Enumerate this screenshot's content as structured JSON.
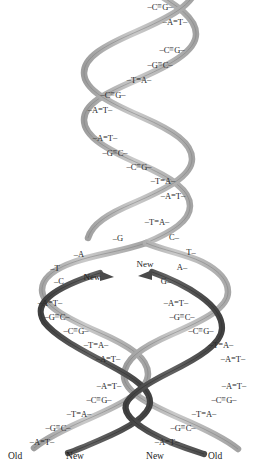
{
  "figure": {
    "colors": {
      "old_strand": "#b4b4b4",
      "old_strand_edge": "#8a8a8a",
      "new_strand": "#555555",
      "new_strand_edge": "#3a3a3a",
      "text": "#2a2a2a",
      "background": "#ffffff"
    }
  },
  "parent_helix": {
    "name": "parental-double-helix",
    "base_pairs": [
      {
        "left": "C",
        "bond": "triple",
        "right": "G",
        "x": 160,
        "y": 7
      },
      {
        "left": "A",
        "bond": "double",
        "right": "T",
        "x": 175,
        "y": 22
      },
      {
        "left": "C",
        "bond": "triple",
        "right": "G",
        "x": 172,
        "y": 50
      },
      {
        "left": "G",
        "bond": "triple",
        "right": "C",
        "x": 160,
        "y": 65
      },
      {
        "left": "T",
        "bond": "double",
        "right": "A",
        "x": 139,
        "y": 80
      },
      {
        "left": "C",
        "bond": "triple",
        "right": "G",
        "x": 113,
        "y": 95
      },
      {
        "left": "A",
        "bond": "double",
        "right": "T",
        "x": 100,
        "y": 110
      },
      {
        "left": "A",
        "bond": "double",
        "right": "T",
        "x": 105,
        "y": 138
      },
      {
        "left": "G",
        "bond": "triple",
        "right": "C",
        "x": 115,
        "y": 153
      },
      {
        "left": "C",
        "bond": "triple",
        "right": "G",
        "x": 139,
        "y": 167
      },
      {
        "left": "T",
        "bond": "double",
        "right": "A",
        "x": 163,
        "y": 181
      },
      {
        "left": "A",
        "bond": "double",
        "right": "T",
        "x": 173,
        "y": 196
      },
      {
        "left": "T",
        "bond": "double",
        "right": "A",
        "x": 157,
        "y": 222
      }
    ]
  },
  "fork": {
    "name": "replication-fork",
    "left_unpaired": [
      {
        "base": "G",
        "x": 118,
        "y": 238
      },
      {
        "base": "A",
        "x": 79,
        "y": 254
      },
      {
        "base": "T",
        "x": 55,
        "y": 268
      },
      {
        "base": "C",
        "x": 59,
        "y": 281
      }
    ],
    "right_unpaired": [
      {
        "base": "C",
        "x": 174,
        "y": 237
      },
      {
        "base": "T",
        "x": 191,
        "y": 252
      },
      {
        "base": "A",
        "x": 182,
        "y": 267
      },
      {
        "base": "G",
        "x": 166,
        "y": 281
      }
    ],
    "new_labels": [
      {
        "text": "New",
        "x": 92,
        "y": 277
      },
      {
        "text": "New",
        "x": 145,
        "y": 264
      }
    ]
  },
  "left_daughter": {
    "name": "left-daughter-helix",
    "base_pairs": [
      {
        "left": "A",
        "bond": "double",
        "right": "T",
        "x": 50,
        "y": 303
      },
      {
        "left": "G",
        "bond": "triple",
        "right": "C",
        "x": 57,
        "y": 317
      },
      {
        "left": "C",
        "bond": "triple",
        "right": "G",
        "x": 76,
        "y": 331
      },
      {
        "left": "T",
        "bond": "double",
        "right": "A",
        "x": 96,
        "y": 345
      },
      {
        "left": "A",
        "bond": "double",
        "right": "T",
        "x": 108,
        "y": 359
      },
      {
        "left": "A",
        "bond": "double",
        "right": "T",
        "x": 109,
        "y": 386
      },
      {
        "left": "C",
        "bond": "triple",
        "right": "G",
        "x": 99,
        "y": 400
      },
      {
        "left": "T",
        "bond": "double",
        "right": "A",
        "x": 79,
        "y": 414
      },
      {
        "left": "G",
        "bond": "triple",
        "right": "C",
        "x": 58,
        "y": 428
      },
      {
        "left": "A",
        "bond": "double",
        "right": "T",
        "x": 42,
        "y": 442
      }
    ]
  },
  "right_daughter": {
    "name": "right-daughter-helix",
    "base_pairs": [
      {
        "left": "A",
        "bond": "double",
        "right": "T",
        "x": 176,
        "y": 303
      },
      {
        "left": "G",
        "bond": "triple",
        "right": "C",
        "x": 182,
        "y": 317
      },
      {
        "left": "C",
        "bond": "triple",
        "right": "G",
        "x": 201,
        "y": 331
      },
      {
        "left": "T",
        "bond": "double",
        "right": "A",
        "x": 221,
        "y": 345
      },
      {
        "left": "A",
        "bond": "double",
        "right": "T",
        "x": 233,
        "y": 359
      },
      {
        "left": "A",
        "bond": "double",
        "right": "T",
        "x": 234,
        "y": 386
      },
      {
        "left": "C",
        "bond": "triple",
        "right": "G",
        "x": 224,
        "y": 400
      },
      {
        "left": "T",
        "bond": "double",
        "right": "A",
        "x": 204,
        "y": 414
      },
      {
        "left": "G",
        "bond": "triple",
        "right": "C",
        "x": 183,
        "y": 428
      },
      {
        "left": "A",
        "bond": "double",
        "right": "T",
        "x": 167,
        "y": 442
      }
    ]
  },
  "bottom_labels": [
    {
      "text": "Old",
      "x": 15,
      "y": 452
    },
    {
      "text": "New",
      "x": 75,
      "y": 452
    },
    {
      "text": "New",
      "x": 155,
      "y": 452
    },
    {
      "text": "Old",
      "x": 215,
      "y": 452
    }
  ]
}
